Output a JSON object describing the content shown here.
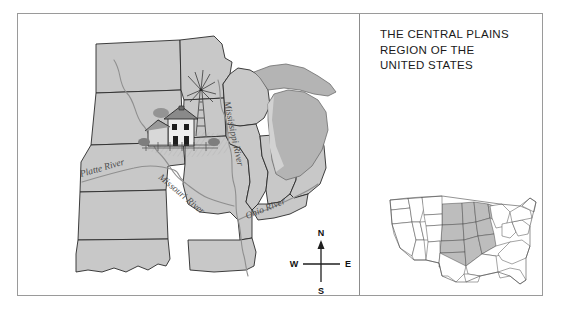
{
  "title": {
    "line1": "THE CENTRAL PLAINS",
    "line2": "REGION OF THE",
    "line3": "UNITED STATES"
  },
  "map": {
    "river_labels": [
      {
        "name": "platte-river",
        "text": "Platte River"
      },
      {
        "name": "missouri-river",
        "text": "Missouri River"
      },
      {
        "name": "mississippi-river",
        "text": "Mississippi River"
      },
      {
        "name": "ohio-river",
        "text": "Ohio River"
      }
    ],
    "illustration": "farmhouse-with-windmill",
    "compass": {
      "north": "N",
      "south": "S",
      "east": "E",
      "west": "W"
    }
  },
  "inset": {
    "name": "united-states-locator-map",
    "highlight_label": "central-plains-region"
  },
  "colors": {
    "frame": "#9a9a9a",
    "divider": "#8c8c8c",
    "state_fill": "#c8c8c8",
    "state_fill_dark": "#b4b4b4",
    "state_outline": "#2a2a2a",
    "river_line": "#8f8f8f",
    "river_text": "#4a4a4a",
    "inset_highlight": "#bdbdbd",
    "inset_fill": "#ffffff",
    "inset_outline": "#4a4a4a",
    "title_text": "#1a1a1a",
    "background": "#ffffff"
  }
}
